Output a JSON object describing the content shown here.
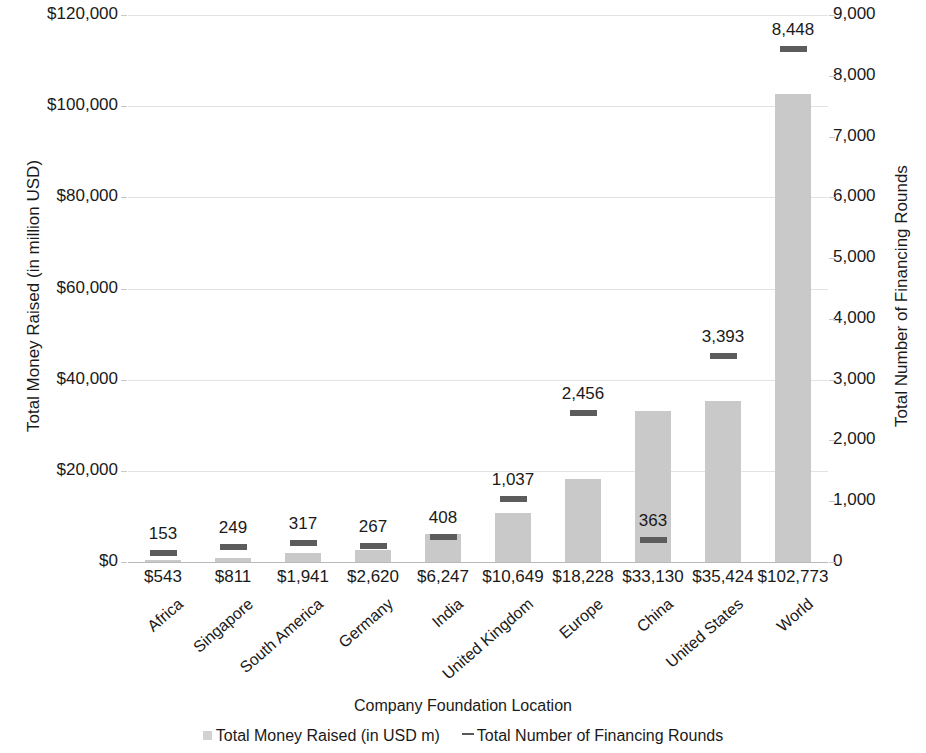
{
  "chart_data": {
    "type": "bar",
    "title": "",
    "xlabel": "Company Foundation Location",
    "ylabel": "Total Money Raised (in million USD)",
    "y2label": "Total Number of Financing Rounds",
    "categories": [
      "Africa",
      "Singapore",
      "South America",
      "Germany",
      "India",
      "United Kingdom",
      "Europe",
      "China",
      "United States",
      "World"
    ],
    "series": [
      {
        "name": "Total Money Raised (in USD m)",
        "type": "bar",
        "axis": "left",
        "values": [
          543,
          811,
          1941,
          2620,
          6247,
          10649,
          18228,
          33130,
          35424,
          102773
        ],
        "value_labels": [
          "$543",
          "$811",
          "$1,941",
          "$2,620",
          "$6,247",
          "$10,649",
          "$18,228",
          "$33,130",
          "$35,424",
          "$102,773"
        ],
        "color": "#c9c9c9"
      },
      {
        "name": "Total Number of Financing Rounds",
        "type": "marker",
        "axis": "right",
        "values": [
          153,
          249,
          317,
          267,
          408,
          1037,
          2456,
          363,
          3393,
          8448
        ],
        "value_labels": [
          "153",
          "249",
          "317",
          "267",
          "408",
          "1,037",
          "2,456",
          "363",
          "3,393",
          "8,448"
        ],
        "color": "#5c5c5c"
      }
    ],
    "yticks": [
      "$0",
      "$20,000",
      "$40,000",
      "$60,000",
      "$80,000",
      "$100,000",
      "$120,000"
    ],
    "ytick_values": [
      0,
      20000,
      40000,
      60000,
      80000,
      100000,
      120000
    ],
    "ylim": [
      0,
      120000
    ],
    "y2ticks": [
      "0",
      "1,000",
      "2,000",
      "3,000",
      "4,000",
      "5,000",
      "6,000",
      "7,000",
      "8,000",
      "9,000"
    ],
    "y2tick_values": [
      0,
      1000,
      2000,
      3000,
      4000,
      5000,
      6000,
      7000,
      8000,
      9000
    ],
    "y2lim": [
      0,
      9000
    ],
    "grid": true,
    "legend_position": "bottom"
  },
  "legend": {
    "items": [
      {
        "label": "Total Money Raised (in USD m)",
        "marker": "square",
        "color": "#d2d2d2"
      },
      {
        "label": "Total Number of Financing Rounds",
        "marker": "dash",
        "color": "#595959"
      }
    ]
  }
}
